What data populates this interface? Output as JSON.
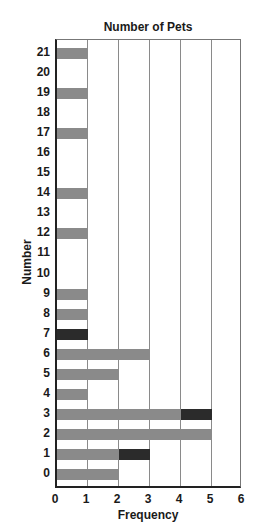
{
  "chart_data": {
    "type": "bar",
    "orientation": "horizontal",
    "stacked": true,
    "title": "Number of Pets",
    "xlabel": "Frequency",
    "ylabel": "Number",
    "xlim": [
      0,
      6
    ],
    "x_ticks": [
      "0",
      "1",
      "2",
      "3",
      "4",
      "5",
      "6"
    ],
    "categories": [
      "0",
      "1",
      "2",
      "3",
      "4",
      "5",
      "6",
      "7",
      "8",
      "9",
      "10",
      "11",
      "12",
      "13",
      "14",
      "15",
      "16",
      "17",
      "18",
      "19",
      "20",
      "21"
    ],
    "series": [
      {
        "name": "light",
        "color": "#8a8a8a",
        "values": [
          2,
          2,
          5,
          4,
          1,
          2,
          3,
          0,
          1,
          1,
          0,
          0,
          1,
          0,
          1,
          0,
          0,
          1,
          0,
          1,
          0,
          1
        ]
      },
      {
        "name": "dark",
        "color": "#2b2b2b",
        "values": [
          0,
          1,
          0,
          1,
          0,
          0,
          0,
          1,
          0,
          0,
          0,
          0,
          0,
          0,
          0,
          0,
          0,
          0,
          0,
          0,
          0,
          0
        ]
      }
    ],
    "totals": [
      2,
      3,
      5,
      5,
      1,
      2,
      3,
      1,
      1,
      1,
      0,
      0,
      1,
      0,
      1,
      0,
      0,
      1,
      0,
      1,
      0,
      1
    ],
    "grid": "vertical",
    "legend": "none"
  }
}
